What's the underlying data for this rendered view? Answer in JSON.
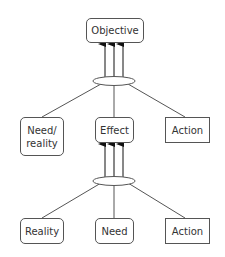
{
  "diagram": {
    "nodes": {
      "objective": "Objective",
      "need_reality": "Need/\nreality",
      "effect": "Effect",
      "action_top": "Action",
      "reality": "Reality",
      "need": "Need",
      "action_bottom": "Action"
    },
    "edges": [
      {
        "from": "need_reality",
        "to": "ellipse_top"
      },
      {
        "from": "effect",
        "to": "ellipse_top"
      },
      {
        "from": "action_top",
        "to": "ellipse_top"
      },
      {
        "from": "ellipse_top",
        "to": "objective",
        "arrows": 3
      },
      {
        "from": "reality",
        "to": "ellipse_bottom"
      },
      {
        "from": "need",
        "to": "ellipse_bottom"
      },
      {
        "from": "action_bottom",
        "to": "ellipse_bottom"
      },
      {
        "from": "ellipse_bottom",
        "to": "effect",
        "arrows": 3
      }
    ],
    "colors": {
      "stroke": "#555555",
      "text": "#333333",
      "background": "#ffffff"
    }
  }
}
